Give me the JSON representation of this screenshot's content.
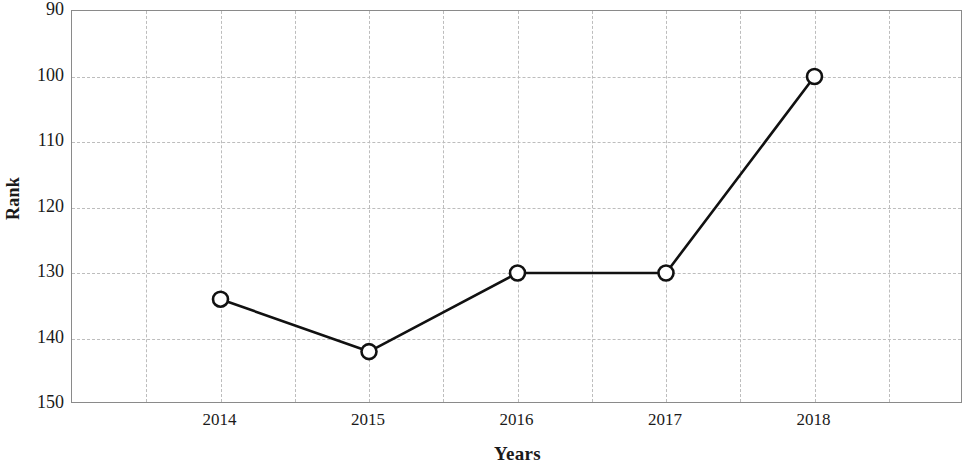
{
  "chart_data": {
    "type": "line",
    "title": "",
    "xlabel": "Years",
    "ylabel": "Rank",
    "categories": [
      "2014",
      "2015",
      "2016",
      "2017",
      "2018"
    ],
    "x": [
      2014,
      2015,
      2016,
      2017,
      2018
    ],
    "values": [
      134,
      142,
      130,
      130,
      100
    ],
    "series": [
      {
        "name": "Rank",
        "values": [
          134,
          142,
          130,
          130,
          100
        ]
      }
    ],
    "ylim": [
      90,
      150
    ],
    "y_inverted": true,
    "yticks": [
      90,
      100,
      110,
      120,
      130,
      140,
      150
    ],
    "ytick_labels": [
      "90",
      "100",
      "110",
      "120",
      "130",
      "140",
      "150"
    ],
    "xtick_labels": [
      "2014",
      "2015",
      "2016",
      "2017",
      "2018"
    ],
    "grid": true,
    "legend": false,
    "legend_position": "none",
    "line_color": "#111111",
    "marker": "circle-open",
    "marker_face_color": "#ffffff",
    "grid_color": "#bdbdbd",
    "axis_color": "#8a8a8a",
    "background_color": "#ffffff"
  }
}
